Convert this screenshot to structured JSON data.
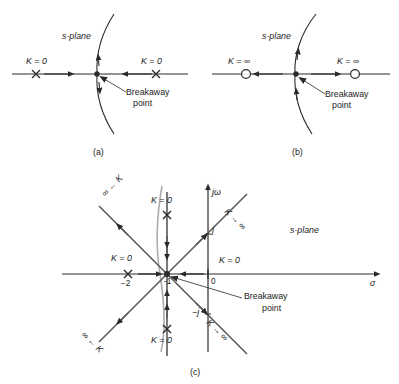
{
  "figure": {
    "panels": [
      {
        "id": "a",
        "caption": "(a)",
        "plane_label": "s-plane",
        "breakaway_label_line1": "Breakaway",
        "breakaway_label_line2": "point",
        "left_gain_label": "K = 0",
        "right_gain_label": "K = 0",
        "left_marker": "pole-x",
        "right_marker": "pole-x",
        "breakaway_marker": "filled-dot",
        "description": "Two open-loop poles on the real axis; locus breaks away vertically between them."
      },
      {
        "id": "b",
        "caption": "(b)",
        "plane_label": "s-plane",
        "breakaway_label_line1": "Breakaway",
        "breakaway_label_line2": "point",
        "left_gain_label": "K = ∞",
        "right_gain_label": "K = ∞",
        "left_marker": "zero-circle",
        "right_marker": "zero-circle",
        "breakaway_marker": "filled-dot",
        "description": "Two open-loop zeros on the real axis; locus breaks in vertically between them."
      },
      {
        "id": "c",
        "caption": "(c)",
        "plane_label": "s-plane",
        "axis_real": "σ",
        "axis_imag": "jω",
        "origin_label": "0",
        "breakaway_label_line1": "Breakaway",
        "breakaway_label_line2": "point",
        "breakaway_value": "-1",
        "tick_minus2": "−2",
        "tick_j": "j",
        "tick_minus_j": "−j",
        "gain_labels": [
          {
            "name": "pole-real-axis",
            "text": "K = 0"
          },
          {
            "name": "pole-upper-imag",
            "text": "K = 0"
          },
          {
            "name": "pole-lower-imag",
            "text": "K = 0"
          },
          {
            "name": "origin-zero",
            "text": "K = 0"
          },
          {
            "name": "asymptote-upper-left",
            "text": "∞ ← K"
          },
          {
            "name": "asymptote-lower-left",
            "text": "∞ ← K"
          },
          {
            "name": "asymptote-upper-right",
            "text": "K → ∞"
          },
          {
            "name": "asymptote-lower-right",
            "text": "K → ∞"
          }
        ],
        "description": "Root locus with poles at -2, -1+j, -1-j, zero at origin; breakaway point at -1."
      }
    ]
  },
  "colors": {
    "ink": "#2a2a2a",
    "light_branch": "#9a9a9a",
    "background": "#ffffff",
    "text": "#1b1b1b"
  }
}
